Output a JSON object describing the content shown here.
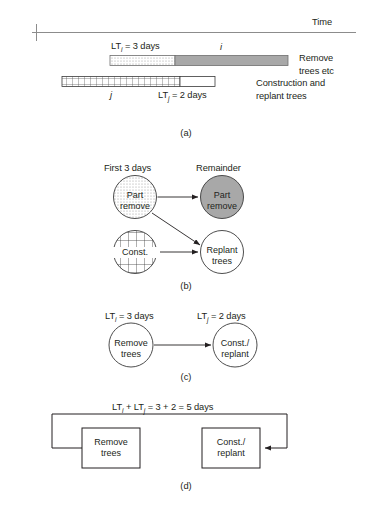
{
  "figure": {
    "axis": {
      "label": "Time"
    },
    "panels": [
      {
        "tag": "(a)"
      },
      {
        "tag": "(b)"
      },
      {
        "tag": "(c)"
      },
      {
        "tag": "(d)"
      }
    ]
  },
  "panel_a": {
    "bar_i": {
      "lead_label_prefix": "LT",
      "lead_label_sub": "i",
      "lead_label_suffix": " = 3 days",
      "activity_label": "i",
      "right_label_line1": "Remove",
      "right_label_line2": "trees etc"
    },
    "bar_j": {
      "activity_label": "j",
      "lead_label_prefix": "LT",
      "lead_label_sub": "j",
      "lead_label_suffix": " = 2 days",
      "right_label_line1": "Construction and",
      "right_label_line2": "replant trees"
    }
  },
  "panel_b": {
    "col_header_left": "First 3 days",
    "col_header_right": "Remainder",
    "nodes": [
      {
        "id": "part-remove-first",
        "line1": "Part",
        "line2": "remove",
        "fill": "dotted"
      },
      {
        "id": "part-remove-remainder",
        "line1": "Part",
        "line2": "remove",
        "fill": "gray"
      },
      {
        "id": "const",
        "line1": "Const.",
        "line2": "",
        "fill": "grid"
      },
      {
        "id": "replant-trees",
        "line1": "Replant",
        "line2": "trees",
        "fill": "white"
      }
    ]
  },
  "panel_c": {
    "left_lead_prefix": "LT",
    "left_lead_sub": "i",
    "left_lead_suffix": " = 3 days",
    "right_lead_prefix": "LT",
    "right_lead_sub": "j",
    "right_lead_suffix": " = 2 days",
    "node_left_line1": "Remove",
    "node_left_line2": "trees",
    "node_right_line1": "Const./",
    "node_right_line2": "replant"
  },
  "panel_d": {
    "equation_prefix": "LT",
    "equation_sub1": "i",
    "equation_mid": " + LT",
    "equation_sub2": "j",
    "equation_suffix": " = 3 + 2 = 5 days",
    "box_left_line1": "Remove",
    "box_left_line2": "trees",
    "box_right_line1": "Const./",
    "box_right_line2": "replant"
  },
  "colors": {
    "ink": "#231f20",
    "gray_fill": "#a8a8a8",
    "axis_line": "#8c8c8c",
    "stroke": "#3a3a3a"
  }
}
